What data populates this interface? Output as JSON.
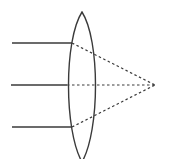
{
  "diagram": {
    "colors": {
      "stroke": "#3a3a3a",
      "background": "#ffffff"
    },
    "lens": {
      "type": "biconvex",
      "center_x": 82,
      "top_y": 12,
      "bottom_y": 162,
      "half_width": 15
    },
    "focal_point": {
      "x": 155,
      "y": 85
    },
    "rays": [
      {
        "name": "top-ray",
        "start_x": 12,
        "y": 43,
        "lens_x": 72
      },
      {
        "name": "middle-ray",
        "start_x": 11,
        "y": 85,
        "lens_x": 67
      },
      {
        "name": "bottom-ray",
        "start_x": 12,
        "y": 127,
        "lens_x": 72
      }
    ]
  }
}
